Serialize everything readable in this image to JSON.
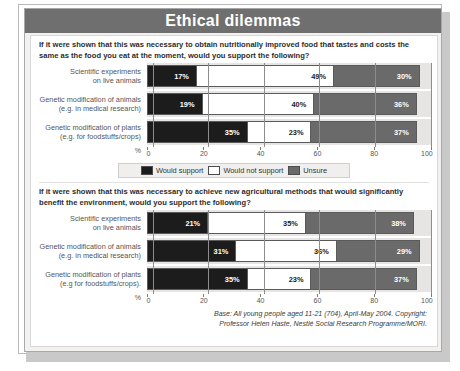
{
  "title": "Ethical dilemmas",
  "legend": {
    "items": [
      {
        "key": "support",
        "label": "Would support",
        "color": "#1c1c1c"
      },
      {
        "key": "nosupport",
        "label": "Would not support",
        "color": "#ffffff"
      },
      {
        "key": "unsure",
        "label": "Unsure",
        "color": "#6a6a6a"
      }
    ]
  },
  "axis": {
    "percent_symbol": "%",
    "ticks": [
      "0",
      "20",
      "40",
      "60",
      "80",
      "100"
    ]
  },
  "sections": [
    {
      "question": "If it were shown that this was necessary to obtain nutritionally improved food that tastes and costs the same as the food you eat at the moment, would you support the following?",
      "categories": [
        {
          "line1": "Scientific experiments",
          "line2": "on live animals"
        },
        {
          "line1": "Genetic modification of animals",
          "line2": "(e.g. in medical research)"
        },
        {
          "line1": "Genetic modification of plants",
          "line2": "(e.g. for foodstuffs/crops)"
        }
      ],
      "values": [
        {
          "support": "17%",
          "nosupport": "49%",
          "unsure": "30%"
        },
        {
          "support": "19%",
          "nosupport": "40%",
          "unsure": "36%"
        },
        {
          "support": "35%",
          "nosupport": "23%",
          "unsure": "37%"
        }
      ]
    },
    {
      "question": "If it were shown that this was necessary to achieve new agricultural methods that would significantly benefit the environment, would you support the following?",
      "categories": [
        {
          "line1": "Scientific experiments",
          "line2": "on live animals"
        },
        {
          "line1": "Genetic modification of animals",
          "line2": "(e.g. in medical research)"
        },
        {
          "line1": "Genetic modification of plants",
          "line2": "(e.g for foodstuffs/crops)."
        }
      ],
      "values": [
        {
          "support": "21%",
          "nosupport": "35%",
          "unsure": "38%"
        },
        {
          "support": "31%",
          "nosupport": "36%",
          "unsure": "29%"
        },
        {
          "support": "35%",
          "nosupport": "23%",
          "unsure": "37%"
        }
      ]
    }
  ],
  "footnote": {
    "line1": "Base: All young people aged 11-21 (704), April-May 2004. Copyright:",
    "line2": "Professor Helen Haste, Nestlé Social Research Programme/MORI."
  },
  "chart_data": [
    {
      "type": "bar",
      "orientation": "horizontal",
      "stacked": true,
      "title": "Ethical dilemmas",
      "subtitle": "If it were shown that this was necessary to obtain nutritionally improved food that tastes and costs the same as the food you eat at the moment, would you support the following?",
      "xlabel": "%",
      "ylabel": "",
      "xlim": [
        0,
        100
      ],
      "xticks": [
        0,
        20,
        40,
        60,
        80,
        100
      ],
      "grid": true,
      "legend_position": "bottom",
      "categories": [
        "Scientific experiments on live animals",
        "Genetic modification of animals (e.g. in medical research)",
        "Genetic modification of plants (e.g. for foodstuffs/crops)"
      ],
      "series": [
        {
          "name": "Would support",
          "values": [
            17,
            19,
            35
          ],
          "color": "#1c1c1c"
        },
        {
          "name": "Would not support",
          "values": [
            49,
            40,
            23
          ],
          "color": "#ffffff"
        },
        {
          "name": "Unsure",
          "values": [
            30,
            36,
            37
          ],
          "color": "#6a6a6a"
        }
      ]
    },
    {
      "type": "bar",
      "orientation": "horizontal",
      "stacked": true,
      "title": "Ethical dilemmas",
      "subtitle": "If it were shown that this was necessary to achieve new agricultural methods that would significantly benefit the environment, would you support the following?",
      "xlabel": "%",
      "ylabel": "",
      "xlim": [
        0,
        100
      ],
      "xticks": [
        0,
        20,
        40,
        60,
        80,
        100
      ],
      "grid": true,
      "legend_position": "bottom",
      "categories": [
        "Scientific experiments on live animals",
        "Genetic modification of animals (e.g. in medical research)",
        "Genetic modification of plants (e.g for foodstuffs/crops)."
      ],
      "series": [
        {
          "name": "Would support",
          "values": [
            21,
            31,
            35
          ],
          "color": "#1c1c1c"
        },
        {
          "name": "Would not support",
          "values": [
            35,
            36,
            23
          ],
          "color": "#ffffff"
        },
        {
          "name": "Unsure",
          "values": [
            38,
            29,
            37
          ],
          "color": "#6a6a6a"
        }
      ]
    }
  ]
}
